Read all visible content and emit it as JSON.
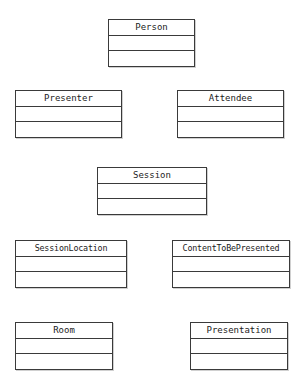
{
  "diagram": {
    "kind": "uml-class-diagram",
    "background_color": "#ffffff",
    "line_color": "#3a3a3a",
    "text_color": "#1c1c1c",
    "classes": [
      {
        "name": "Person",
        "attributes": [],
        "operations": [],
        "x": 108,
        "y": 19,
        "width": 87,
        "height": 48
      },
      {
        "name": "Presenter",
        "attributes": [],
        "operations": [],
        "x": 15,
        "y": 90,
        "width": 107,
        "height": 48
      },
      {
        "name": "Attendee",
        "attributes": [],
        "operations": [],
        "x": 177,
        "y": 90,
        "width": 107,
        "height": 48
      },
      {
        "name": "Session",
        "attributes": [],
        "operations": [],
        "x": 97,
        "y": 167,
        "width": 110,
        "height": 48
      },
      {
        "name": "SessionLocation",
        "attributes": [],
        "operations": [],
        "x": 15,
        "y": 240,
        "width": 112,
        "height": 48
      },
      {
        "name": "ContentToBePresented",
        "attributes": [],
        "operations": [],
        "x": 172,
        "y": 240,
        "width": 118,
        "height": 48
      },
      {
        "name": "Room",
        "attributes": [],
        "operations": [],
        "x": 15,
        "y": 322,
        "width": 98,
        "height": 48
      },
      {
        "name": "Presentation",
        "attributes": [],
        "operations": [],
        "x": 190,
        "y": 322,
        "width": 98,
        "height": 48
      }
    ]
  }
}
